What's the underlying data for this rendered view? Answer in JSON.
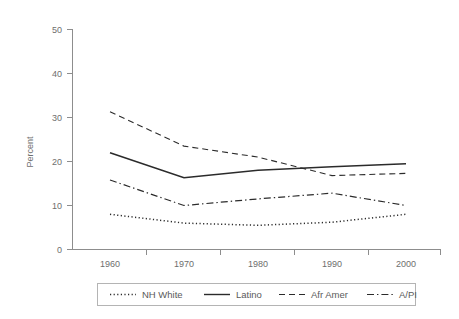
{
  "chart_data": {
    "type": "line",
    "title": "",
    "subtitle": "",
    "xlabel": "",
    "ylabel": "Percent",
    "x": [
      1960,
      1970,
      1980,
      1990,
      2000
    ],
    "xtick_labels": [
      "1960",
      "1970",
      "1980",
      "1990",
      "2000"
    ],
    "ytick_labels": [
      "0",
      "10",
      "20",
      "30",
      "40",
      "50"
    ],
    "ytick_values": [
      0,
      10,
      20,
      30,
      40,
      50
    ],
    "xlim": [
      1955,
      2005
    ],
    "ylim": [
      0,
      50
    ],
    "grid": false,
    "legend_position": "bottom",
    "series": [
      {
        "name": "NH White",
        "values": [
          8.0,
          6.0,
          5.5,
          6.2,
          8.0
        ],
        "style": "dotted",
        "color": "#2b2b2b"
      },
      {
        "name": "Latino",
        "values": [
          22.0,
          16.3,
          18.0,
          18.8,
          19.5
        ],
        "style": "solid",
        "color": "#2b2b2b"
      },
      {
        "name": "Afr Amer",
        "values": [
          31.3,
          23.5,
          21.0,
          16.8,
          17.3
        ],
        "style": "dashed",
        "color": "#6b6b6b"
      },
      {
        "name": "A/PI",
        "values": [
          15.8,
          10.0,
          11.5,
          12.8,
          10.0
        ],
        "style": "dashdot",
        "color": "#2b2b2b"
      }
    ]
  },
  "legend": {
    "entries": [
      {
        "label": "NH White",
        "style": "dotted"
      },
      {
        "label": "Latino",
        "style": "solid"
      },
      {
        "label": "Afr Amer",
        "style": "dashed"
      },
      {
        "label": "A/PI",
        "style": "dashdot"
      }
    ]
  }
}
